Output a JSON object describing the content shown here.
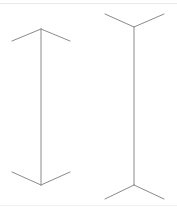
{
  "figure": {
    "title": "Muller-Lyer illusion figure",
    "background_color": "#ffffff",
    "stroke_color": "#8a8a8a",
    "stroke_width": 1,
    "rule_color": "#e9e9e9",
    "canvas": {
      "width": 177,
      "height": 209
    },
    "shapes": [
      {
        "name": "left-arrow-figure",
        "label": "Arrowheads-in figure",
        "shaft": {
          "x1": 41,
          "y1": 29,
          "x2": 41,
          "y2": 185
        },
        "fins": [
          {
            "name": "top-left-fin",
            "x1": 41,
            "y1": 29,
            "x2": 12,
            "y2": 41
          },
          {
            "name": "top-right-fin",
            "x1": 41,
            "y1": 29,
            "x2": 70,
            "y2": 41
          },
          {
            "name": "bottom-left-fin",
            "x1": 41,
            "y1": 185,
            "x2": 12,
            "y2": 172
          },
          {
            "name": "bottom-right-fin",
            "x1": 41,
            "y1": 185,
            "x2": 70,
            "y2": 172
          }
        ]
      },
      {
        "name": "right-arrow-figure",
        "label": "Arrowheads-out figure",
        "shaft": {
          "x1": 134,
          "y1": 27,
          "x2": 134,
          "y2": 185
        },
        "fins": [
          {
            "name": "top-left-fin",
            "x1": 134,
            "y1": 27,
            "x2": 105,
            "y2": 14
          },
          {
            "name": "top-right-fin",
            "x1": 134,
            "y1": 27,
            "x2": 164,
            "y2": 14
          },
          {
            "name": "bottom-left-fin",
            "x1": 134,
            "y1": 185,
            "x2": 105,
            "y2": 199
          },
          {
            "name": "bottom-right-fin",
            "x1": 134,
            "y1": 185,
            "x2": 164,
            "y2": 199
          }
        ]
      }
    ],
    "rules": [
      {
        "name": "top-rule",
        "y": 3,
        "color": "#e9e9e9"
      },
      {
        "name": "bottom-rule",
        "y": 205,
        "color": "#f1f1f1"
      }
    ]
  }
}
